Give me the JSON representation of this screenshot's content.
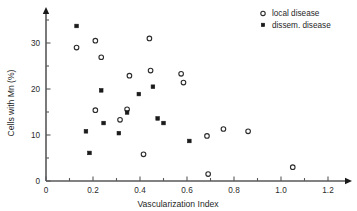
{
  "chart_data": {
    "type": "scatter",
    "title": "",
    "xlabel": "Vascularization Index",
    "ylabel": "Cells with Mn  (%)",
    "xlim": [
      0,
      1.3
    ],
    "ylim": [
      0,
      35
    ],
    "xticks": [
      "0",
      "0.2",
      "0.4",
      "0.6",
      "0.8",
      "1.0",
      "1.2"
    ],
    "xtick_values": [
      0,
      0.2,
      0.4,
      0.6,
      0.8,
      1.0,
      1.2
    ],
    "xminor_values": [
      0.1,
      0.3,
      0.5,
      0.7,
      0.9,
      1.1
    ],
    "yticks": [
      "0",
      "10",
      "20",
      "30"
    ],
    "ytick_values": [
      0,
      10,
      20,
      30
    ],
    "yminor_values": [
      5,
      15,
      25,
      35
    ],
    "grid": false,
    "legend_position": "top-right",
    "series": [
      {
        "name": "local disease",
        "marker": "open-circle",
        "color": "#2b2b2b",
        "points": [
          {
            "x": 0.13,
            "y": 29.0
          },
          {
            "x": 0.21,
            "y": 30.5
          },
          {
            "x": 0.235,
            "y": 26.9
          },
          {
            "x": 0.21,
            "y": 15.4
          },
          {
            "x": 0.315,
            "y": 13.3
          },
          {
            "x": 0.345,
            "y": 15.6
          },
          {
            "x": 0.355,
            "y": 22.9
          },
          {
            "x": 0.415,
            "y": 5.8
          },
          {
            "x": 0.44,
            "y": 31.0
          },
          {
            "x": 0.445,
            "y": 24.0
          },
          {
            "x": 0.575,
            "y": 23.3
          },
          {
            "x": 0.585,
            "y": 21.4
          },
          {
            "x": 0.685,
            "y": 9.8
          },
          {
            "x": 0.69,
            "y": 1.5
          },
          {
            "x": 0.755,
            "y": 11.3
          },
          {
            "x": 0.86,
            "y": 10.8
          },
          {
            "x": 1.05,
            "y": 3.0
          }
        ]
      },
      {
        "name": "dissem. disease",
        "marker": "filled-square",
        "color": "#1a1a1a",
        "points": [
          {
            "x": 0.13,
            "y": 33.7
          },
          {
            "x": 0.17,
            "y": 10.8
          },
          {
            "x": 0.185,
            "y": 6.1
          },
          {
            "x": 0.235,
            "y": 19.7
          },
          {
            "x": 0.245,
            "y": 12.6
          },
          {
            "x": 0.31,
            "y": 10.4
          },
          {
            "x": 0.345,
            "y": 14.9
          },
          {
            "x": 0.395,
            "y": 18.9
          },
          {
            "x": 0.455,
            "y": 20.5
          },
          {
            "x": 0.475,
            "y": 13.6
          },
          {
            "x": 0.5,
            "y": 12.6
          },
          {
            "x": 0.61,
            "y": 8.7
          }
        ]
      }
    ]
  },
  "legend": {
    "entries": [
      {
        "label": "local disease",
        "marker": "open-circle"
      },
      {
        "label": "dissem. disease",
        "marker": "filled-square"
      }
    ]
  }
}
